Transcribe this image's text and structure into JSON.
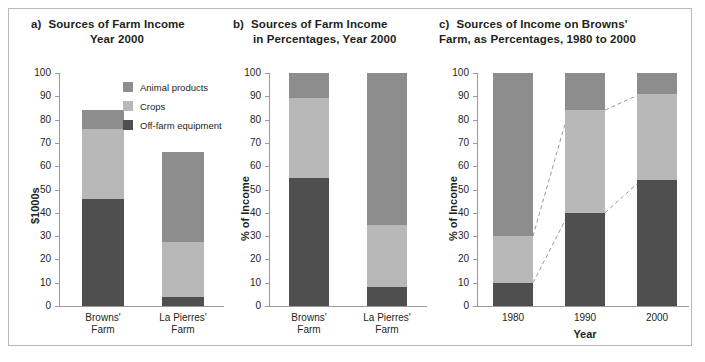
{
  "legend": {
    "items": [
      {
        "label": "Animal products",
        "color": "#8d8d8d",
        "key": "animal"
      },
      {
        "label": "Crops",
        "color": "#b8b8b8",
        "key": "crops"
      },
      {
        "label": "Off-farm equipment",
        "color": "#4f4f4f",
        "key": "offfarm"
      }
    ]
  },
  "panels": {
    "a": {
      "letter": "a)",
      "title_line1": "Sources of Farm Income",
      "title_line2": "Year 2000",
      "ylabel": "$1000s",
      "yticks": [
        "100",
        "90",
        "80",
        "70",
        "60",
        "50",
        "40",
        "30",
        "20",
        "10",
        "0"
      ],
      "xlabels": [
        {
          "l1": "Browns'",
          "l2": "Farm"
        },
        {
          "l1": "La Pierres'",
          "l2": "Farm"
        }
      ]
    },
    "b": {
      "letter": "b)",
      "title_line1": "Sources of Farm Income",
      "title_line2": "in Percentages, Year 2000",
      "ylabel": "% of Income",
      "yticks": [
        "100",
        "90",
        "80",
        "70",
        "60",
        "50",
        "40",
        "30",
        "20",
        "10",
        "0"
      ],
      "xlabels": [
        {
          "l1": "Browns'",
          "l2": "Farm"
        },
        {
          "l1": "La Pierres'",
          "l2": "Farm"
        }
      ]
    },
    "c": {
      "letter": "c)",
      "title_line1": "Sources of Income on Browns'",
      "title_line2": "Farm, as Percentages, 1980 to 2000",
      "ylabel": "% of Income",
      "xtitle": "Year",
      "yticks": [
        "100",
        "90",
        "80",
        "70",
        "60",
        "50",
        "40",
        "30",
        "20",
        "10",
        "0"
      ],
      "xlabels": [
        {
          "l1": "1980",
          "l2": ""
        },
        {
          "l1": "1990",
          "l2": ""
        },
        {
          "l1": "2000",
          "l2": ""
        }
      ]
    }
  },
  "chart_data": [
    {
      "panel": "a",
      "type": "bar",
      "stacked": true,
      "title": "a) Sources of Farm Income Year 2000",
      "xlabel": "",
      "ylabel": "$1000s",
      "ylim": [
        0,
        100
      ],
      "yticks": [
        0,
        10,
        20,
        30,
        40,
        50,
        60,
        70,
        80,
        90,
        100
      ],
      "grid": false,
      "legend_position": "top-right-inside",
      "categories": [
        "Browns' Farm",
        "La Pierres' Farm"
      ],
      "series": [
        {
          "name": "Off-farm equipment",
          "color": "#4f4f4f",
          "values": [
            46,
            4
          ]
        },
        {
          "name": "Crops",
          "color": "#b8b8b8",
          "values": [
            30,
            23.5
          ]
        },
        {
          "name": "Animal products",
          "color": "#8d8d8d",
          "values": [
            8,
            38.5
          ]
        }
      ],
      "cumulative_tops": [
        [
          46,
          76,
          84
        ],
        [
          4,
          27.5,
          66
        ]
      ]
    },
    {
      "panel": "b",
      "type": "bar",
      "stacked": true,
      "title": "b) Sources of Farm Income in Percentages, Year 2000",
      "xlabel": "",
      "ylabel": "% of Income",
      "ylim": [
        0,
        100
      ],
      "yticks": [
        0,
        10,
        20,
        30,
        40,
        50,
        60,
        70,
        80,
        90,
        100
      ],
      "grid": false,
      "categories": [
        "Browns' Farm",
        "La Pierres' Farm"
      ],
      "series": [
        {
          "name": "Off-farm equipment",
          "color": "#4f4f4f",
          "values": [
            55,
            8
          ]
        },
        {
          "name": "Crops",
          "color": "#b8b8b8",
          "values": [
            34.5,
            27
          ]
        },
        {
          "name": "Animal products",
          "color": "#8d8d8d",
          "values": [
            10.5,
            65
          ]
        }
      ],
      "cumulative_tops": [
        [
          55,
          89.5,
          100
        ],
        [
          8,
          35,
          100
        ]
      ]
    },
    {
      "panel": "c",
      "type": "bar",
      "stacked": true,
      "title": "c) Sources of Income on Browns' Farm, as Percentages, 1980 to 2000",
      "xlabel": "Year",
      "ylabel": "% of Income",
      "ylim": [
        0,
        100
      ],
      "yticks": [
        0,
        10,
        20,
        30,
        40,
        50,
        60,
        70,
        80,
        90,
        100
      ],
      "grid": false,
      "categories": [
        "1980",
        "1990",
        "2000"
      ],
      "series": [
        {
          "name": "Off-farm equipment",
          "color": "#4f4f4f",
          "values": [
            10,
            40,
            54
          ]
        },
        {
          "name": "Crops",
          "color": "#b8b8b8",
          "values": [
            20,
            44,
            37
          ]
        },
        {
          "name": "Animal products",
          "color": "#8d8d8d",
          "values": [
            70,
            16,
            9
          ]
        }
      ],
      "cumulative_tops": [
        [
          10,
          30,
          100
        ],
        [
          40,
          84,
          100
        ],
        [
          54,
          91,
          100
        ]
      ],
      "annotations": [
        {
          "type": "dashed-connector",
          "from": {
            "bar": "1980",
            "level": 10
          },
          "to": {
            "bar": "1990",
            "level": 40
          }
        },
        {
          "type": "dashed-connector",
          "from": {
            "bar": "1980",
            "level": 30
          },
          "to": {
            "bar": "1990",
            "level": 84
          }
        },
        {
          "type": "dashed-connector",
          "from": {
            "bar": "1990",
            "level": 40
          },
          "to": {
            "bar": "2000",
            "level": 54
          }
        },
        {
          "type": "dashed-connector",
          "from": {
            "bar": "1990",
            "level": 84
          },
          "to": {
            "bar": "2000",
            "level": 91
          }
        }
      ]
    }
  ]
}
